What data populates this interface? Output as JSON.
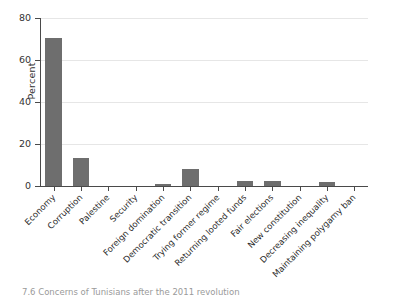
{
  "chart_data": {
    "type": "bar",
    "title": "",
    "xlabel": "",
    "ylabel": "Percent",
    "ylim": [
      0,
      80
    ],
    "yticks": [
      0,
      20,
      40,
      60,
      80
    ],
    "grid": true,
    "legend": "none",
    "orientation": "vertical",
    "bar_color": "#6e6e6e",
    "categories": [
      "Economy",
      "Corruption",
      "Palestine",
      "Security",
      "Foreign domination",
      "Democratic transition",
      "Trying former regime",
      "Returning looted funds",
      "Fair elections",
      "New constitution",
      "Decreasing inequality",
      "Maintaining polygamy ban"
    ],
    "values": [
      70.5,
      13.5,
      0.0,
      0.0,
      1.0,
      8.0,
      0.0,
      2.5,
      2.5,
      0.0,
      2.0,
      0.0
    ]
  },
  "axes": {
    "y_title": "Percent",
    "y_tick_labels": [
      "0",
      "20",
      "40",
      "60",
      "80"
    ]
  },
  "caption": {
    "text": "7.6 Concerns of Tunisians after the 2011 revolution"
  }
}
